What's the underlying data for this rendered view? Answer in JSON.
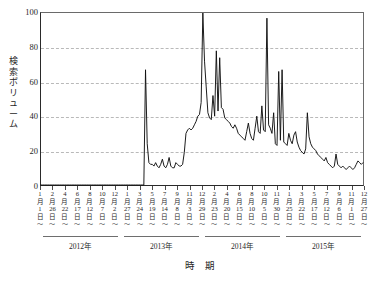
{
  "chart_data": {
    "type": "line",
    "title": "",
    "xlabel": "時 期",
    "ylabel": "検索ボリューム",
    "ylim": [
      0,
      100
    ],
    "yticks": [
      0,
      20,
      40,
      60,
      80,
      100
    ],
    "grid": true,
    "gridlines_at": [
      20,
      40,
      60,
      80
    ],
    "legend": null,
    "x_group_labels": [
      "2012年",
      "2013年",
      "2014年",
      "2015年"
    ],
    "x_tick_labels": [
      {
        "month": "1",
        "day": "1"
      },
      {
        "month": "2",
        "day": "26"
      },
      {
        "month": "4",
        "day": "22"
      },
      {
        "month": "6",
        "day": "17"
      },
      {
        "month": "8",
        "day": "12"
      },
      {
        "month": "10",
        "day": "7"
      },
      {
        "month": "12",
        "day": "2"
      },
      {
        "month": "1",
        "day": "27"
      },
      {
        "month": "3",
        "day": "24"
      },
      {
        "month": "5",
        "day": "19"
      },
      {
        "month": "7",
        "day": "14"
      },
      {
        "month": "9",
        "day": "8"
      },
      {
        "month": "11",
        "day": "3"
      },
      {
        "month": "12",
        "day": "29"
      },
      {
        "month": "2",
        "day": "23"
      },
      {
        "month": "4",
        "day": "20"
      },
      {
        "month": "6",
        "day": "15"
      },
      {
        "month": "8",
        "day": "10"
      },
      {
        "month": "10",
        "day": "5"
      },
      {
        "month": "11",
        "day": "30"
      },
      {
        "month": "1",
        "day": "25"
      },
      {
        "month": "3",
        "day": "22"
      },
      {
        "month": "5",
        "day": "17"
      },
      {
        "month": "7",
        "day": "12"
      },
      {
        "month": "9",
        "day": "6"
      },
      {
        "month": "11",
        "day": "1"
      },
      {
        "month": "12",
        "day": "27"
      }
    ],
    "month_suffix": "月",
    "day_suffix": "日",
    "tick_tail_glyph": "〜",
    "series": [
      {
        "name": "検索ボリューム",
        "color": "#111111",
        "values": [
          0,
          0,
          0,
          0,
          0,
          0,
          0,
          0,
          0,
          0,
          0,
          0,
          0,
          0,
          0,
          0,
          0,
          0,
          0,
          0,
          0,
          0,
          0,
          0,
          0,
          0,
          0,
          0,
          0,
          0,
          0,
          0,
          0,
          0,
          0,
          0,
          0,
          0,
          0,
          0,
          0,
          0,
          0,
          0,
          0,
          0,
          0,
          0,
          0,
          0,
          0,
          0,
          0,
          0,
          0,
          0,
          0,
          0,
          0,
          0,
          0,
          0,
          67,
          24,
          13,
          12,
          12,
          11,
          13,
          11,
          10,
          12,
          15,
          11,
          10,
          12,
          16,
          11,
          10,
          10,
          13,
          12,
          11,
          11,
          12,
          19,
          30,
          32,
          33,
          32,
          33,
          35,
          37,
          40,
          41,
          48,
          100,
          72,
          57,
          42,
          39,
          38,
          52,
          40,
          78,
          43,
          74,
          45,
          44,
          39,
          38,
          37,
          36,
          34,
          33,
          35,
          33,
          30,
          29,
          28,
          27,
          26,
          31,
          36,
          30,
          27,
          26,
          33,
          40,
          31,
          30,
          46,
          32,
          31,
          97,
          35,
          33,
          30,
          42,
          24,
          23,
          66,
          26,
          67,
          25,
          24,
          23,
          30,
          26,
          24,
          29,
          31,
          25,
          22,
          20,
          19,
          18,
          21,
          42,
          28,
          24,
          22,
          21,
          20,
          18,
          17,
          16,
          15,
          14,
          16,
          13,
          12,
          11,
          10,
          11,
          18,
          12,
          11,
          10,
          11,
          10,
          9,
          10,
          11,
          10,
          9,
          10,
          12,
          14,
          13,
          12,
          13
        ]
      }
    ]
  }
}
